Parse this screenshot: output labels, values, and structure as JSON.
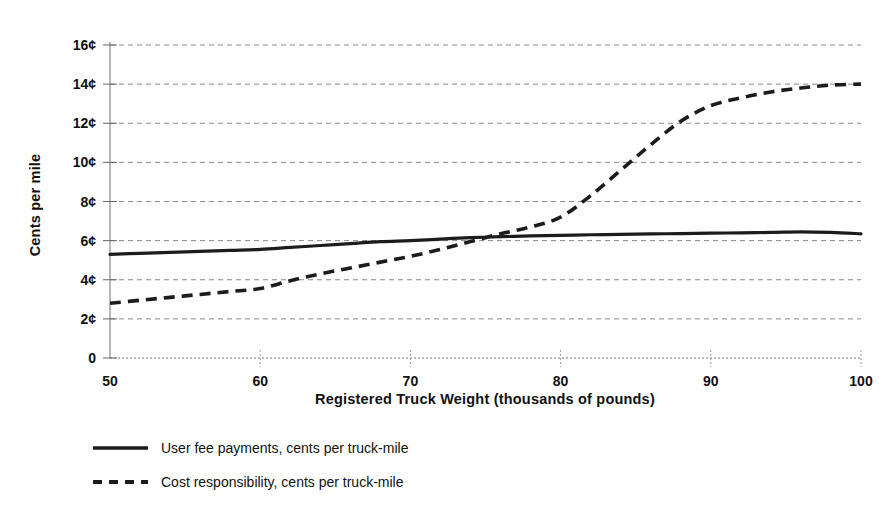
{
  "chart_data": {
    "type": "line",
    "title": "",
    "xlabel": "Registered Truck Weight (thousands of pounds)",
    "ylabel": "Cents per mile",
    "xlim": [
      50,
      100
    ],
    "ylim": [
      0,
      16
    ],
    "grid": true,
    "legend_position": "below-left",
    "x_tick_labels": [
      "50",
      "60",
      "70",
      "80",
      "90",
      "100"
    ],
    "x_tick_values": [
      50,
      60,
      70,
      80,
      90,
      100
    ],
    "y_tick_labels": [
      "0",
      "2¢",
      "4¢",
      "6¢",
      "8¢",
      "10¢",
      "12¢",
      "14¢",
      "16¢"
    ],
    "y_tick_values": [
      0,
      2,
      4,
      6,
      8,
      10,
      12,
      14,
      16
    ],
    "x": [
      50,
      52,
      54,
      56,
      58,
      60,
      62,
      64,
      66,
      68,
      70,
      72,
      74,
      76,
      78,
      80,
      82,
      84,
      86,
      88,
      90,
      92,
      94,
      96,
      98,
      100
    ],
    "series": [
      {
        "name": "User fee payments, cents per truck-mile",
        "style": "solid",
        "color": "#1c1c1c",
        "values": [
          5.3,
          5.35,
          5.4,
          5.45,
          5.5,
          5.55,
          5.65,
          5.75,
          5.85,
          5.95,
          6.0,
          6.08,
          6.15,
          6.2,
          6.24,
          6.27,
          6.3,
          6.32,
          6.34,
          6.36,
          6.38,
          6.4,
          6.42,
          6.45,
          6.42,
          6.35
        ]
      },
      {
        "name": "Cost responsibility, cents per truck-mile",
        "style": "dashed",
        "color": "#1c1c1c",
        "values": [
          2.8,
          2.95,
          3.1,
          3.25,
          3.4,
          3.55,
          3.95,
          4.3,
          4.6,
          4.9,
          5.2,
          5.55,
          5.95,
          6.35,
          6.7,
          7.2,
          8.3,
          9.6,
          10.9,
          12.1,
          12.9,
          13.3,
          13.6,
          13.8,
          13.95,
          14.0
        ]
      }
    ]
  },
  "legend": {
    "items": [
      {
        "label": "User fee payments, cents per truck-mile",
        "style": "solid"
      },
      {
        "label": "Cost responsibility, cents per truck-mile",
        "style": "dashed"
      }
    ]
  }
}
